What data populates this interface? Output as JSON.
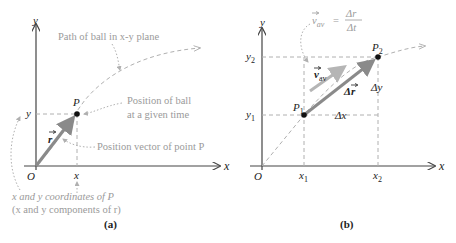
{
  "panel_a": {
    "caption": "(a)",
    "axis_y": "y",
    "axis_x": "x",
    "origin": "O",
    "point": "P",
    "coord_x": "x",
    "coord_y": "y",
    "vector": "r",
    "annotations": {
      "path": "Path of ball in x-y plane",
      "position_line1": "Position of ball",
      "position_line2": "at a given time",
      "vector": "Position vector of point P",
      "coords_line1": "x and y coordinates of P",
      "coords_line2": "(x and y components of r)"
    }
  },
  "panel_b": {
    "caption": "(b)",
    "axis_y": "y",
    "axis_x": "x",
    "origin": "O",
    "p1": "P",
    "p1_sub": "1",
    "p2": "P",
    "p2_sub": "2",
    "x1": "x",
    "x1_sub": "1",
    "x2": "x",
    "x2_sub": "2",
    "y1": "y",
    "y1_sub": "1",
    "y2": "y",
    "y2_sub": "2",
    "delta_x": "Δx",
    "delta_y": "Δy",
    "delta_r": "Δr",
    "v_av": "v",
    "v_av_sub": "av",
    "formula": {
      "lhs": "v",
      "lhs_sub": "av",
      "eq": "=",
      "num": "Δr",
      "den": "Δt"
    }
  },
  "colors": {
    "axis": "#444444",
    "vector": "#8a8a8a",
    "dashed": "#b0b0b0",
    "annotation": "#9a9a9a",
    "point": "#111111"
  }
}
